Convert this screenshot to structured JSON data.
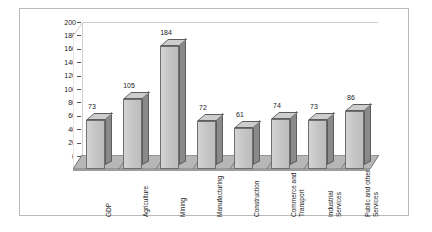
{
  "chart_data": {
    "type": "bar",
    "title": "",
    "subtitle": "",
    "xlabel": "",
    "ylabel": "",
    "ylim": [
      0,
      200
    ],
    "ytick_step": 20,
    "yticks": [
      "200",
      "180",
      "160",
      "140",
      "120",
      "100",
      "80",
      "60",
      "40",
      "20",
      "0"
    ],
    "grid": false,
    "legend": false,
    "three_d": true,
    "categories": [
      "GDP",
      "Agriculture",
      "Mining",
      "Manufacturing",
      "Construction",
      "Commerce and Transport",
      "Industrial Services",
      "Public and other Services"
    ],
    "category_lines": [
      [
        "GDP"
      ],
      [
        "Agriculture"
      ],
      [
        "Mining"
      ],
      [
        "Manufacturing"
      ],
      [
        "Construction"
      ],
      [
        "Commerce and",
        "Transport"
      ],
      [
        "Industrial",
        "Services"
      ],
      [
        "Public and other",
        "Services"
      ]
    ],
    "values": [
      73,
      105,
      184,
      72,
      61,
      74,
      73,
      86
    ],
    "value_labels": [
      "73",
      "105",
      "184",
      "72",
      "61",
      "74",
      "73",
      "86"
    ],
    "colors": {
      "bar_face": "#c9c9c9",
      "bar_side": "#8a8a8a",
      "bar_top": "#cdcdcd",
      "bar_outline": "#6e6e6e",
      "floor": "#b5b5b5",
      "background": "#ffffff",
      "frame_border": "#b9b9b9",
      "text": "#1a1a1a"
    }
  }
}
